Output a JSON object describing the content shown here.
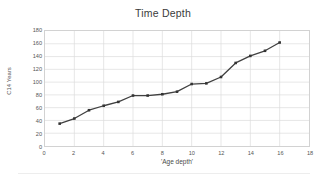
{
  "chart_data": {
    "type": "line",
    "title": "Time Depth",
    "xlabel": "'Age depth'",
    "ylabel": "C14 Years",
    "xlim": [
      0,
      18
    ],
    "ylim": [
      0,
      180
    ],
    "xticks": [
      0,
      2,
      4,
      6,
      8,
      10,
      12,
      14,
      16,
      18
    ],
    "yticks": [
      0,
      20,
      40,
      60,
      80,
      100,
      120,
      140,
      160,
      180
    ],
    "grid": true,
    "legend": "none",
    "marker": "square",
    "line_color": "#404040",
    "marker_color": "#333333",
    "grid_color": "#dcdcdc",
    "x": [
      1,
      2,
      3,
      4,
      5,
      6,
      7,
      8,
      9,
      10,
      11,
      12,
      13,
      14,
      15,
      16
    ],
    "values": [
      35,
      43,
      56,
      63,
      69,
      79,
      79,
      81,
      85,
      97,
      98,
      108,
      130,
      141,
      149,
      162
    ],
    "series": [
      {
        "name": "C14 Years",
        "values": [
          35,
          43,
          56,
          63,
          69,
          79,
          79,
          81,
          85,
          97,
          98,
          108,
          130,
          141,
          149,
          162
        ]
      }
    ]
  }
}
